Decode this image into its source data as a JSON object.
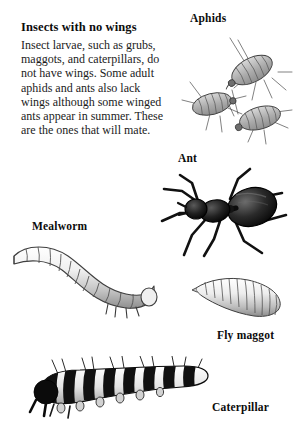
{
  "page": {
    "background_color": "#ffffff",
    "text_color": "#1b1b1b",
    "width": 296,
    "height": 441
  },
  "article": {
    "heading": "Insects with no wings",
    "body": "Insect larvae, such as grubs, maggots, and caterpillars, do not have wings. Some adult aphids and ants also lack wings although some winged ants appear in summer. These are the ones that will mate."
  },
  "figures": [
    {
      "id": "aphids",
      "label": "Aphids",
      "label_position": "above",
      "description": "Three pale gray segmented aphids with long thin legs and antennae",
      "count": 3,
      "body_color": "#b9b9b9",
      "outline_color": "#3a3a3a"
    },
    {
      "id": "ant",
      "label": "Ant",
      "label_position": "above",
      "description": "Dark black ant with large abdomen, narrow waist, head at left and six spread legs",
      "body_color": "#1a1a1a",
      "outline_color": "#000000"
    },
    {
      "id": "mealworm",
      "label": "Mealworm",
      "label_position": "above",
      "description": "Pale segmented mealworm larva curved in an S shape, pointed tail at left, rounded head with small legs at right",
      "segments": 13,
      "body_color": "#e8e8e8",
      "outline_color": "#4a4a4a"
    },
    {
      "id": "fly-maggot",
      "label": "Fly maggot",
      "label_position": "below",
      "description": "Pale tapered fly maggot, narrow pointed head at left widening to blunt rear at right",
      "segments": 12,
      "body_color": "#dcdcdc",
      "outline_color": "#4a4a4a"
    },
    {
      "id": "caterpillar",
      "label": "Caterpillar",
      "label_position": "right",
      "description": "Black and white banded caterpillar with bristles along the back, black head at left and prolegs underneath",
      "segments": 12,
      "body_color": "#f2f2f2",
      "band_color": "#121212",
      "outline_color": "#000000"
    }
  ]
}
